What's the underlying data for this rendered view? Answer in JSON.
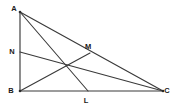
{
  "figure": {
    "background_color": "#ffffff",
    "stroke_color": "#3a3a3a",
    "label_color": "#1a1a1a",
    "width": 174,
    "height": 108
  },
  "labels": {
    "A": "A",
    "B": "B",
    "C": "C",
    "L": "L",
    "M": "M",
    "N": "N"
  },
  "points": {
    "A": {
      "x": 20,
      "y": 12,
      "label_x": 14,
      "label_y": 9
    },
    "B": {
      "x": 20,
      "y": 91,
      "label_x": 11,
      "label_y": 91
    },
    "C": {
      "x": 163,
      "y": 91,
      "label_x": 167,
      "label_y": 91
    },
    "L": {
      "x": 88,
      "y": 91,
      "label_x": 86,
      "label_y": 101
    },
    "M": {
      "x": 90,
      "y": 53,
      "label_x": 88,
      "label_y": 47
    },
    "N": {
      "x": 20,
      "y": 52,
      "label_x": 12,
      "label_y": 52
    },
    "G": {
      "x": 67,
      "y": 66
    }
  },
  "segments": [
    {
      "name": "side-AB",
      "from": "A",
      "to": "B",
      "kind": "edge"
    },
    {
      "name": "side-BC",
      "from": "B",
      "to": "C",
      "kind": "edge"
    },
    {
      "name": "side-AC",
      "from": "A",
      "to": "C",
      "kind": "edge"
    },
    {
      "name": "cevian-AL",
      "from": "A",
      "to": "L",
      "kind": "cevian"
    },
    {
      "name": "cevian-BM",
      "from": "B",
      "to": "M",
      "kind": "cevian"
    },
    {
      "name": "cevian-CN",
      "from": "C",
      "to": "N",
      "kind": "cevian"
    }
  ]
}
